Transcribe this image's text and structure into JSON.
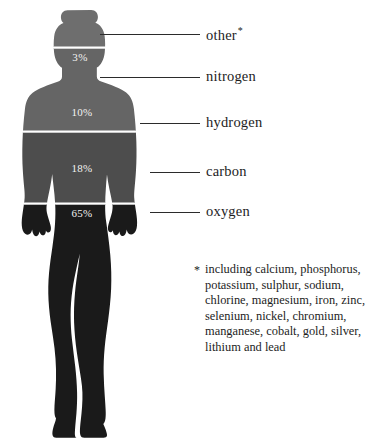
{
  "figure": {
    "alt": "female-body-silhouette",
    "bands": [
      {
        "element": "other",
        "percent_label": "3%",
        "percent": 3,
        "color": "#6e6e6e",
        "region": "head"
      },
      {
        "element": "nitrogen",
        "percent_label": "3%",
        "percent": 3,
        "color": "#6e6e6e",
        "region": "head-lower"
      },
      {
        "element": "hydrogen",
        "percent_label": "10%",
        "percent": 10,
        "color": "#5f5f5f",
        "region": "upper-torso"
      },
      {
        "element": "carbon",
        "percent_label": "18%",
        "percent": 18,
        "color": "#4d4d4d",
        "region": "lower-torso"
      },
      {
        "element": "oxygen",
        "percent_label": "65%",
        "percent": 65,
        "color": "#1a1a1a",
        "region": "hips-and-legs"
      }
    ],
    "percent_marks": [
      {
        "value": "3%"
      },
      {
        "value": "10%"
      },
      {
        "value": "18%"
      },
      {
        "value": "65%"
      }
    ]
  },
  "labels": [
    {
      "text": "other",
      "footnote_marker": "*"
    },
    {
      "text": "nitrogen",
      "footnote_marker": ""
    },
    {
      "text": "hydrogen",
      "footnote_marker": ""
    },
    {
      "text": "carbon",
      "footnote_marker": ""
    },
    {
      "text": "oxygen",
      "footnote_marker": ""
    }
  ],
  "footnote": {
    "marker": "*",
    "text": "including calcium, phosphorus, potassium, sulphur, sodium, chlorine, magnesium, iron, zinc, selenium, nickel, chromium, manganese, cobalt, gold, silver, lithium and lead",
    "elements": [
      "calcium",
      "phosphorus",
      "potassium",
      "sulphur",
      "sodium",
      "chlorine",
      "magnesium",
      "iron",
      "zinc",
      "selenium",
      "nickel",
      "chromium",
      "manganese",
      "cobalt",
      "gold",
      "silver",
      "lithium",
      "lead"
    ]
  },
  "colors": {
    "background": "#ffffff",
    "text": "#1d1d1d",
    "leader_line": "#2b2b2b",
    "band_light": "#6e6e6e",
    "band_mid": "#5f5f5f",
    "band_dark": "#4d4d4d",
    "band_darkest": "#1a1a1a",
    "band_divider": "#ffffff"
  }
}
